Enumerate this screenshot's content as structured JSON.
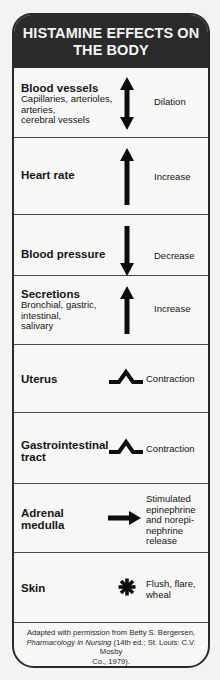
{
  "title": {
    "line1": "HISTAMINE EFFECTS ON",
    "line2": "THE BODY"
  },
  "rows": [
    {
      "title": "Blood vessels",
      "subtitle_lines": [
        "Capillaries, arterioles,",
        "arteries,",
        "cerebral vessels"
      ],
      "icon": "double-arrow-up-down-icon",
      "effect_lines": [
        "Dilation"
      ]
    },
    {
      "title": "Heart rate",
      "subtitle_lines": [],
      "icon": "arrow-up-icon",
      "effect_lines": [
        "Increase"
      ]
    },
    {
      "title": "Blood pressure",
      "subtitle_lines": [],
      "icon": "arrow-down-icon",
      "effect_lines": [
        "Decrease"
      ]
    },
    {
      "title": "Secretions",
      "subtitle_lines": [
        "Bronchial, gastric,",
        "intestinal,",
        "salivary"
      ],
      "icon": "arrow-up-icon",
      "effect_lines": [
        "Increase"
      ]
    },
    {
      "title": "Uterus",
      "subtitle_lines": [],
      "icon": "contraction-peak-icon",
      "effect_lines": [
        "Contraction"
      ]
    },
    {
      "title_lines": [
        "Gastrointestinal",
        "tract"
      ],
      "subtitle_lines": [],
      "icon": "contraction-peak-icon",
      "effect_lines": [
        "Contraction"
      ]
    },
    {
      "title_lines": [
        "Adrenal",
        "medulla"
      ],
      "subtitle_lines": [],
      "icon": "arrow-right-icon",
      "effect_lines": [
        "Stimulated",
        "epinephrine",
        "and norepi-",
        "nephrine",
        "release"
      ]
    },
    {
      "title": "Skin",
      "subtitle_lines": [],
      "icon": "asterisk-icon",
      "effect_lines": [
        "Flush, flare,",
        "wheal"
      ]
    }
  ],
  "footer": {
    "line1": "Adapted with permission from Betty S. Bergersen,",
    "italic_title": "Pharmacology in Nursing",
    "line2_rest": " (14th ed.; St. Louis: C.V. Mosby",
    "line3": "Co., 1979)."
  },
  "colors": {
    "header_bg": "#2b2b2b",
    "header_text": "#f4f4f4",
    "border": "#2a2a2a",
    "background": "#f7f7f5",
    "icon": "#0d0d0d"
  }
}
